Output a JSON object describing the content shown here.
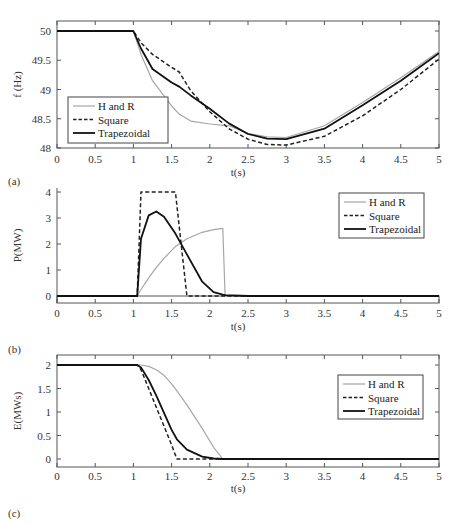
{
  "figure": {
    "panels": [
      "(a)",
      "(b)",
      "(c)"
    ],
    "legend": [
      "H and R",
      "Square",
      "Trapezoidal"
    ],
    "colors": {
      "h_and_r": "#a6a6a6",
      "square": "#222222",
      "trapezoidal": "#111111",
      "axis": "#555555"
    }
  },
  "chart_data": [
    {
      "panel": "(a)",
      "type": "line",
      "title": "",
      "xlabel": "t(s)",
      "ylabel": "f (Hz)",
      "xlim": [
        0,
        5
      ],
      "ylim": [
        48,
        50.2
      ],
      "xticks": [
        "0",
        "0.5",
        "1",
        "1.5",
        "2",
        "2.5",
        "3",
        "3.5",
        "4",
        "4.5",
        "5"
      ],
      "yticks": [
        "48",
        "48.5",
        "49",
        "49.5",
        "50"
      ],
      "legend_position": "lower left",
      "grid": false,
      "x": [
        0,
        1,
        1.1,
        1.25,
        1.5,
        1.6,
        1.75,
        2,
        2.25,
        2.5,
        2.75,
        3,
        3.5,
        4,
        4.5,
        5
      ],
      "series": [
        {
          "name": "H and R",
          "style": "solid-gray",
          "values": [
            50,
            50,
            49.6,
            49.15,
            48.72,
            48.58,
            48.46,
            48.41,
            48.38,
            48.25,
            48.19,
            48.18,
            48.38,
            48.78,
            49.2,
            49.65
          ]
        },
        {
          "name": "Square",
          "style": "dashed-black",
          "values": [
            50,
            50,
            49.8,
            49.6,
            49.38,
            49.3,
            48.98,
            48.62,
            48.33,
            48.15,
            48.06,
            48.05,
            48.2,
            48.55,
            49.0,
            49.52
          ]
        },
        {
          "name": "Trapezoidal",
          "style": "solid-black",
          "values": [
            50,
            50,
            49.7,
            49.35,
            49.12,
            49.05,
            48.9,
            48.67,
            48.42,
            48.24,
            48.16,
            48.15,
            48.33,
            48.73,
            49.15,
            49.62
          ]
        }
      ]
    },
    {
      "panel": "(b)",
      "type": "line",
      "title": "",
      "xlabel": "t(s)",
      "ylabel": "P(MW)",
      "xlim": [
        0,
        5
      ],
      "ylim": [
        -0.2,
        4
      ],
      "xticks": [
        "0",
        "0.5",
        "1",
        "1.5",
        "2",
        "2.5",
        "3",
        "3.5",
        "4",
        "4.5",
        "5"
      ],
      "yticks": [
        "0",
        "1",
        "2",
        "3",
        "4"
      ],
      "legend_position": "upper right",
      "grid": false,
      "x": [
        0,
        1.05,
        1.1,
        1.2,
        1.3,
        1.4,
        1.55,
        1.7,
        1.9,
        2.05,
        2.17,
        2.2,
        2.5,
        5
      ],
      "series": [
        {
          "name": "H and R",
          "style": "solid-gray",
          "values": [
            0,
            0,
            0.25,
            0.7,
            1.1,
            1.45,
            1.9,
            2.2,
            2.45,
            2.55,
            2.6,
            0,
            0,
            0
          ]
        },
        {
          "name": "Square",
          "style": "dashed-black",
          "values": [
            0,
            0,
            4,
            4,
            4,
            4,
            4,
            0,
            0,
            0,
            0,
            0,
            0,
            0
          ]
        },
        {
          "name": "Trapezoidal",
          "style": "solid-black",
          "values": [
            0,
            0,
            2.2,
            3.1,
            3.25,
            3.05,
            2.4,
            1.6,
            0.55,
            0.15,
            0.05,
            0.03,
            0,
            0
          ]
        }
      ]
    },
    {
      "panel": "(c)",
      "type": "line",
      "title": "",
      "xlabel": "t(s)",
      "ylabel": "E(MWs)",
      "xlim": [
        0,
        5
      ],
      "ylim": [
        -0.2,
        2.2
      ],
      "xticks": [
        "0",
        "0.5",
        "1",
        "1.5",
        "2",
        "2.5",
        "3",
        "3.5",
        "4",
        "4.5",
        "5"
      ],
      "yticks": [
        "0",
        "0.5",
        "1",
        "1.5",
        "2"
      ],
      "legend_position": "upper right",
      "grid": false,
      "x": [
        0,
        1.05,
        1.1,
        1.2,
        1.3,
        1.4,
        1.5,
        1.57,
        1.7,
        1.9,
        2.05,
        2.17,
        5
      ],
      "series": [
        {
          "name": "H and R",
          "style": "solid-gray",
          "values": [
            2,
            2,
            2,
            1.97,
            1.9,
            1.78,
            1.6,
            1.45,
            1.15,
            0.65,
            0.25,
            0,
            0
          ]
        },
        {
          "name": "Square",
          "style": "dashed-black",
          "values": [
            2,
            2,
            1.9,
            1.5,
            1.1,
            0.7,
            0.3,
            0,
            0,
            0,
            0,
            0,
            0
          ]
        },
        {
          "name": "Trapezoidal",
          "style": "solid-black",
          "values": [
            2,
            2,
            1.95,
            1.68,
            1.35,
            0.98,
            0.62,
            0.42,
            0.2,
            0.05,
            0.01,
            0,
            0
          ]
        }
      ]
    }
  ]
}
